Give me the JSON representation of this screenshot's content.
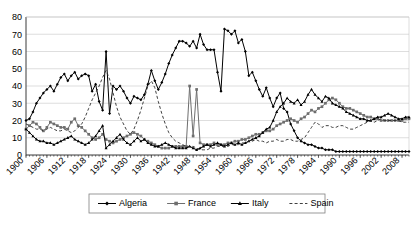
{
  "chart_data": {
    "type": "line",
    "title": "",
    "xlabel": "",
    "ylabel": "",
    "ylim": [
      0,
      80
    ],
    "ytick_step": 10,
    "ytick_labels": [
      "0",
      "10",
      "20",
      "30",
      "40",
      "50",
      "60",
      "70",
      "80"
    ],
    "grid": true,
    "grid_axis": "y",
    "legend_position": "bottom",
    "xlim": [
      1900,
      2010
    ],
    "xtick_label_step": 6,
    "xtick_labels": [
      "1900",
      "1906",
      "1912",
      "1918",
      "1924",
      "1930",
      "1936",
      "1942",
      "1948",
      "1954",
      "1960",
      "1966",
      "1972",
      "1978",
      "1984",
      "1990",
      "1996",
      "2002",
      "2008"
    ],
    "x_start": 1900,
    "x_end": 2010,
    "series": [
      {
        "name": "Algeria",
        "marker": "diamond",
        "dash": "solid",
        "color": "#000000",
        "values": [
          20,
          21,
          25,
          30,
          33,
          36,
          38,
          40,
          37,
          41,
          45,
          47,
          43,
          46,
          48,
          44,
          46,
          47,
          46,
          37,
          41,
          31,
          26,
          60,
          24,
          40,
          38,
          40,
          37,
          33,
          30,
          34,
          33,
          32,
          35,
          41,
          49,
          43,
          38,
          42,
          47,
          53,
          58,
          62,
          66,
          66,
          65,
          63,
          66,
          62,
          70,
          64,
          61,
          61,
          61,
          48,
          37,
          73,
          72,
          70,
          72,
          65,
          67,
          60,
          46,
          48,
          43,
          38,
          34,
          39,
          33,
          28,
          33,
          36,
          27,
          25,
          18,
          14,
          10,
          8,
          7,
          6,
          6,
          5,
          4,
          4,
          3,
          3,
          3,
          2,
          2,
          2,
          2,
          2,
          2,
          2,
          2,
          2,
          2,
          2,
          2,
          2,
          2,
          2,
          2,
          2,
          2,
          2,
          2,
          2,
          2
        ]
      },
      {
        "name": "France",
        "marker": "square",
        "dash": "solid",
        "color": "#6e6e6e",
        "values": [
          15,
          17,
          19,
          18,
          16,
          14,
          16,
          19,
          18,
          17,
          16,
          16,
          15,
          19,
          21,
          17,
          16,
          14,
          12,
          10,
          9,
          10,
          12,
          9,
          8,
          7,
          8,
          9,
          10,
          11,
          12,
          13,
          12,
          11,
          9,
          8,
          7,
          6,
          5,
          4,
          4,
          4,
          5,
          5,
          5,
          5,
          5,
          40,
          11,
          38,
          7,
          6,
          6,
          6,
          7,
          6,
          6,
          6,
          7,
          7,
          8,
          8,
          9,
          9,
          10,
          11,
          12,
          12,
          13,
          14,
          14,
          15,
          17,
          18,
          19,
          20,
          21,
          20,
          19,
          21,
          22,
          24,
          26,
          25,
          27,
          28,
          30,
          32,
          33,
          32,
          30,
          28,
          27,
          27,
          26,
          25,
          24,
          23,
          22,
          22,
          21,
          21,
          20,
          20,
          20,
          20,
          20,
          20,
          20,
          21,
          21
        ]
      },
      {
        "name": "Italy",
        "marker": "triangle",
        "dash": "solid",
        "color": "#000000",
        "values": [
          15,
          13,
          11,
          9,
          8,
          8,
          7,
          7,
          6,
          7,
          8,
          9,
          10,
          11,
          9,
          8,
          7,
          6,
          7,
          9,
          11,
          14,
          17,
          4,
          6,
          8,
          10,
          12,
          9,
          7,
          6,
          8,
          10,
          8,
          9,
          7,
          6,
          5,
          5,
          6,
          7,
          6,
          5,
          4,
          4,
          4,
          4,
          5,
          4,
          3,
          4,
          5,
          6,
          5,
          6,
          7,
          6,
          5,
          6,
          7,
          6,
          7,
          6,
          7,
          8,
          9,
          10,
          11,
          13,
          15,
          16,
          20,
          25,
          28,
          30,
          33,
          31,
          30,
          32,
          29,
          31,
          35,
          38,
          35,
          33,
          31,
          34,
          33,
          30,
          29,
          28,
          27,
          25,
          24,
          23,
          22,
          21,
          21,
          20,
          20,
          21,
          22,
          22,
          23,
          24,
          23,
          22,
          21,
          21,
          22,
          22
        ]
      },
      {
        "name": "Spain",
        "marker": "none",
        "dash": "dashed",
        "color": "#2a2a2a",
        "values": [
          18,
          17,
          16,
          15,
          15,
          14,
          15,
          16,
          15,
          14,
          14,
          15,
          14,
          13,
          14,
          16,
          18,
          22,
          27,
          32,
          36,
          40,
          45,
          49,
          44,
          36,
          28,
          22,
          18,
          14,
          12,
          15,
          20,
          26,
          33,
          40,
          43,
          39,
          31,
          24,
          18,
          13,
          10,
          8,
          7,
          6,
          5,
          5,
          5,
          4,
          3,
          3,
          3,
          4,
          4,
          5,
          5,
          5,
          5,
          6,
          6,
          6,
          7,
          7,
          8,
          8,
          9,
          8,
          8,
          7,
          8,
          8,
          9,
          8,
          8,
          9,
          9,
          8,
          8,
          9,
          10,
          13,
          16,
          19,
          18,
          16,
          17,
          17,
          16,
          16,
          17,
          17,
          16,
          15,
          15,
          16,
          17,
          18,
          19,
          20,
          19,
          20,
          21,
          20,
          20,
          20,
          20,
          20,
          19,
          19,
          19
        ]
      }
    ]
  },
  "legend": {
    "items": [
      {
        "label": "Algeria"
      },
      {
        "label": "France"
      },
      {
        "label": "Italy"
      },
      {
        "label": "Spain"
      }
    ]
  }
}
